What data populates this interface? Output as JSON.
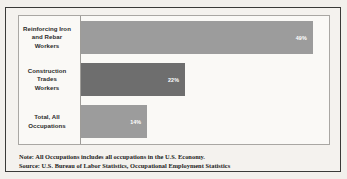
{
  "chart_data": {
    "type": "bar",
    "orientation": "horizontal",
    "title": "",
    "subtitle": "",
    "xlabel": "",
    "ylabel": "",
    "categories": [
      "Reinforcing Iron and Rebar Workers",
      "Construction Trades Workers",
      "Total, All Occupations"
    ],
    "values": [
      49,
      22,
      14
    ],
    "value_labels": [
      "49%",
      "22%",
      "14%"
    ],
    "value_unit": "%",
    "xlim": [
      0,
      52
    ],
    "grid": false,
    "legend": null,
    "series": [
      {
        "name": "Percent",
        "values": [
          49,
          22,
          14
        ]
      }
    ],
    "bar_colors": [
      "#9c9c9c",
      "#6e6e6e",
      "#9c9c9c"
    ],
    "annotations": [
      "Note: All Occupations includes all occupations in the U.S. Economy.",
      "Source: U.S. Bureau of Labor Statistics, Occupational Employment Statistics"
    ]
  },
  "categories": [
    {
      "label": "Reinforcing Iron and Rebar Workers",
      "label_lines": [
        "Reinforcing Iron",
        "and Rebar",
        "Workers"
      ],
      "value_label": "49%"
    },
    {
      "label": "Construction Trades Workers",
      "label_lines": [
        "Construction",
        "Trades",
        "Workers"
      ],
      "value_label": "22%"
    },
    {
      "label": "Total, All Occupations",
      "label_lines": [
        "Total, All",
        "Occupations"
      ],
      "value_label": "14%"
    }
  ],
  "footnotes": {
    "note": "Note: All Occupations includes all occupations in the U.S. Economy.",
    "source": "Source: U.S. Bureau of Labor Statistics, Occupational Employment Statistics"
  },
  "colors": {
    "bar_light": "#9c9c9c",
    "bar_dark": "#6e6e6e",
    "frame": "#3a3a38",
    "plot_border": "#a9a7a3",
    "background": "#f2f0ec",
    "plot_background": "#faf9f6",
    "text": "#2b2b2a",
    "value_text": "#ffffff"
  }
}
